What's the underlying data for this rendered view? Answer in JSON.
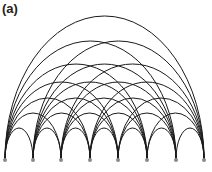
{
  "figure": {
    "panel_label": "(a)",
    "type": "arc diagram",
    "graph": "complete graph K8",
    "node_count": 8,
    "node_color": "#8a8a8a",
    "edge_color": "#1a1a1a",
    "nodes_x": [
      5,
      33,
      61,
      90,
      118,
      147,
      176,
      204
    ],
    "node_y": 159,
    "arc_apex_y_by_span": {
      "1": 128,
      "2": 113,
      "3": 98,
      "4": 82,
      "5": 64,
      "6": 41,
      "7": 16
    }
  }
}
